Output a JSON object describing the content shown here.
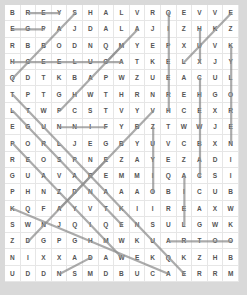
{
  "puzzle": {
    "cols": 15,
    "rows": 17,
    "grid": [
      "BREYSHALVRQEVVE",
      "EGPAJDALAJIZHKZ",
      "RBBODNQMYEPXUVK",
      "HCEELUGATKELXJY",
      "QDTKBAPWZUEACUL",
      "TPTGHWTHRNREHGO",
      "LTWPCSTVYVHCEXR",
      "EGUNNIFYBZTWWJE",
      "PORLJEGBYUVCBXN",
      "REOSPNEZAYEZADI",
      "GUAVAREMMIQACSI",
      "PHNZDNAAAOBICUB",
      "KQFAYVTKIIREAXW",
      "SWNJQIQENSULGWK",
      "ZDGPGHMWKUARTOO",
      "NIXXADAWEKQKZHB",
      "UDDNSMDBUCAERRM"
    ],
    "found_lines": [
      {
        "from": [
          0,
          1
        ],
        "to": [
          0,
          3
        ]
      },
      {
        "from": [
          1,
          0
        ],
        "to": [
          1,
          2
        ]
      },
      {
        "from": [
          0,
          4
        ],
        "to": [
          4,
          0
        ]
      },
      {
        "from": [
          3,
          0
        ],
        "to": [
          3,
          7
        ]
      },
      {
        "from": [
          2,
          7
        ],
        "to": [
          6,
          3
        ]
      },
      {
        "from": [
          1,
          8
        ],
        "to": [
          3,
          6
        ]
      },
      {
        "from": [
          0,
          10
        ],
        "to": [
          6,
          10
        ]
      },
      {
        "from": [
          0,
          14
        ],
        "to": [
          3,
          11
        ]
      },
      {
        "from": [
          1,
          12
        ],
        "to": [
          3,
          12
        ]
      },
      {
        "from": [
          2,
          14
        ],
        "to": [
          8,
          14
        ]
      },
      {
        "from": [
          4,
          12
        ],
        "to": [
          10,
          12
        ]
      },
      {
        "from": [
          5,
          0
        ],
        "to": [
          16,
          11
        ]
      },
      {
        "from": [
          6,
          0
        ],
        "to": [
          13,
          7
        ]
      },
      {
        "from": [
          7,
          3
        ],
        "to": [
          7,
          6
        ]
      },
      {
        "from": [
          8,
          0
        ],
        "to": [
          15,
          7
        ]
      },
      {
        "from": [
          6,
          9
        ],
        "to": [
          12,
          3
        ]
      },
      {
        "from": [
          7,
          9
        ],
        "to": [
          11,
          9
        ]
      },
      {
        "from": [
          10,
          11
        ],
        "to": [
          13,
          11
        ]
      },
      {
        "from": [
          14,
          10
        ],
        "to": [
          14,
          14
        ]
      },
      {
        "from": [
          9,
          6
        ],
        "to": [
          14,
          1
        ]
      },
      {
        "from": [
          15,
          5
        ],
        "to": [
          16,
          3
        ]
      },
      {
        "from": [
          12,
          0
        ],
        "to": [
          16,
          10
        ]
      }
    ]
  }
}
